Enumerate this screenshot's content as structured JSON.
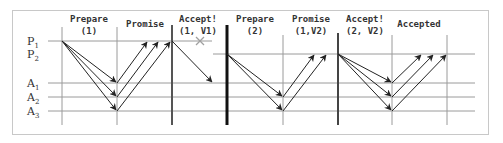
{
  "diagram": {
    "rows": [
      {
        "id": "P1",
        "label": "P",
        "sub": "1",
        "y": 41
      },
      {
        "id": "P2",
        "label": "P",
        "sub": "2",
        "y": 54
      },
      {
        "id": "A1",
        "label": "A",
        "sub": "1",
        "y": 83
      },
      {
        "id": "A2",
        "label": "A",
        "sub": "2",
        "y": 97
      },
      {
        "id": "A3",
        "label": "A",
        "sub": "3",
        "y": 111
      }
    ],
    "phases": [
      {
        "line1": "Prepare",
        "line2": "(1)"
      },
      {
        "line1": "Promise",
        "line2": ""
      },
      {
        "line1": "Accept!",
        "line2": "(1, V1)"
      },
      {
        "line1": "Prepare",
        "line2": "(2)"
      },
      {
        "line1": "Promise",
        "line2": "(1,V2)"
      },
      {
        "line1": "Accept!",
        "line2": "(2, V2)"
      },
      {
        "line1": "Accepted",
        "line2": ""
      }
    ],
    "annotations": {
      "failed_message_mark": "×"
    },
    "colors": {
      "grid": "#9a9a9a",
      "arrow": "#222222",
      "failure": "#a0a0a0",
      "frame": "#c8c8c8"
    }
  }
}
